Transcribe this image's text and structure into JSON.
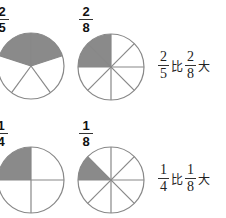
{
  "rows": [
    {
      "left": {
        "num": "2",
        "den": "5",
        "parts": 5,
        "shaded": 2
      },
      "right": {
        "num": "2",
        "den": "8",
        "parts": 8,
        "shaded": 2
      },
      "comparison": {
        "a_num": "2",
        "a_den": "5",
        "word1": "比",
        "b_num": "2",
        "b_den": "8",
        "word2": "大"
      }
    },
    {
      "left": {
        "num": "1",
        "den": "4",
        "parts": 4,
        "shaded": 1
      },
      "right": {
        "num": "1",
        "den": "8",
        "parts": 8,
        "shaded": 1
      },
      "comparison": {
        "a_num": "1",
        "a_den": "4",
        "word1": "比",
        "b_num": "1",
        "b_den": "8",
        "word2": "大"
      }
    }
  ],
  "colors": {
    "shade": "#8a8a8a",
    "stroke": "#888888"
  }
}
